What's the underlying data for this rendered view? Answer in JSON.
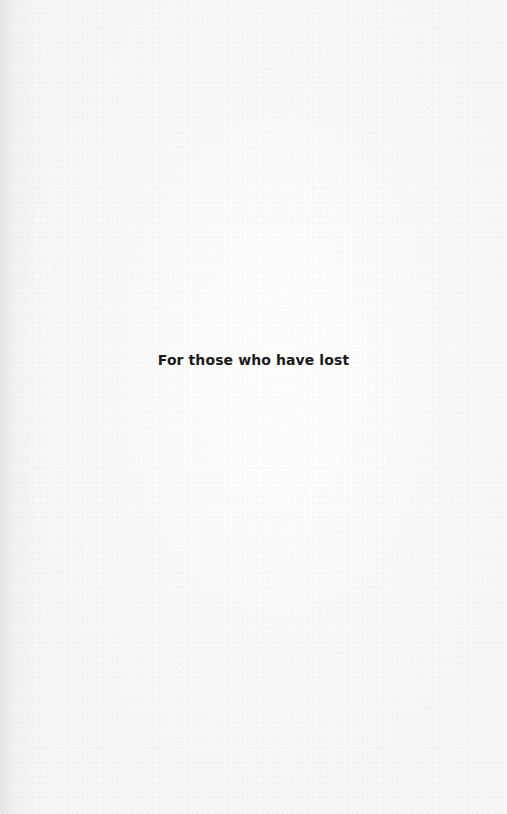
{
  "page": {
    "dedication": "For those who have lost"
  },
  "colors": {
    "background": "#f6f6f5",
    "text": "#1a1a1a"
  }
}
